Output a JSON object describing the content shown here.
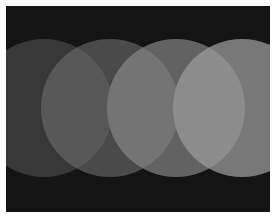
{
  "caption": {
    "text": "— ———— ——— ——————"
  },
  "image": {
    "description": "Four overlapping gray circles on a black background, increasing in brightness left to right",
    "background_color": "#141414",
    "circles": [
      {
        "name": "circle-1",
        "cx": 38,
        "cy": 102,
        "r": 69,
        "color": "#383838"
      },
      {
        "name": "circle-2",
        "cx": 104,
        "cy": 102,
        "r": 69,
        "color": "#4a4a4a"
      },
      {
        "name": "circle-3",
        "cx": 170,
        "cy": 102,
        "r": 69,
        "color": "#626262"
      },
      {
        "name": "circle-4",
        "cx": 236,
        "cy": 102,
        "r": 69,
        "color": "#787878"
      }
    ],
    "overlaps": [
      {
        "name": "overlap-1-2",
        "color": "#585858"
      },
      {
        "name": "overlap-2-3",
        "color": "#747474"
      },
      {
        "name": "overlap-3-4",
        "color": "#8c8c8c"
      }
    ]
  }
}
